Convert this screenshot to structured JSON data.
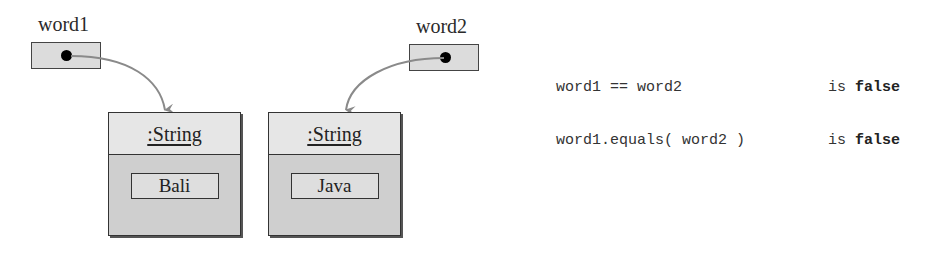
{
  "diagram": {
    "variables": [
      {
        "name": "word1"
      },
      {
        "name": "word2"
      }
    ],
    "objects": [
      {
        "type": ":String",
        "value": "Bali"
      },
      {
        "type": ":String",
        "value": "Java"
      }
    ],
    "comparisons": [
      {
        "expression": "word1 == word2",
        "verb": "is",
        "result": "false"
      },
      {
        "expression": "word1.equals( word2 )",
        "verb": "is",
        "result": "false"
      }
    ],
    "colors": {
      "arrow": "#8a8a8a",
      "ref_box_fill": "#dcdcdc",
      "object_header_fill": "#e6e6e6",
      "object_body_fill": "#cfcfcf"
    }
  }
}
